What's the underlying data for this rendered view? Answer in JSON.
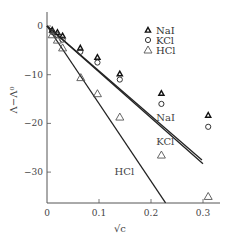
{
  "chart_data": {
    "type": "scatter",
    "title": "",
    "xlabel": "√c",
    "ylabel": "Λ − Λ⁰",
    "xlim": [
      0,
      0.335
    ],
    "ylim": [
      -36,
      3
    ],
    "xticks": [
      0,
      0.1,
      0.2,
      0.3
    ],
    "xtick_labels": [
      "0",
      "0.1",
      "0.2",
      "0.3"
    ],
    "yticks": [
      0,
      -10,
      -20,
      -30
    ],
    "ytick_labels": [
      "0",
      "−10",
      "−20",
      "−30"
    ],
    "grid": false,
    "legend_position": "upper-center-right",
    "series": [
      {
        "name": "NaI",
        "marker": "filled-small-triangle",
        "points": [
          [
            0.01,
            -0.8
          ],
          [
            0.02,
            -1.3
          ],
          [
            0.03,
            -2.0
          ],
          [
            0.064,
            -4.5
          ],
          [
            0.097,
            -6.4
          ],
          [
            0.14,
            -9.8
          ],
          [
            0.22,
            -13.8
          ],
          [
            0.31,
            -18.3
          ]
        ]
      },
      {
        "name": "KCl",
        "marker": "circle",
        "points": [
          [
            0.01,
            -1.2
          ],
          [
            0.02,
            -1.9
          ],
          [
            0.03,
            -2.8
          ],
          [
            0.064,
            -5.3
          ],
          [
            0.097,
            -7.5
          ],
          [
            0.14,
            -11.0
          ],
          [
            0.22,
            -16.0
          ],
          [
            0.31,
            -20.7
          ]
        ]
      },
      {
        "name": "HCl",
        "marker": "open-triangle",
        "points": [
          [
            0.01,
            -1.8
          ],
          [
            0.02,
            -2.9
          ],
          [
            0.03,
            -4.5
          ],
          [
            0.065,
            -10.6
          ],
          [
            0.097,
            -13.9
          ],
          [
            0.14,
            -18.7
          ],
          [
            0.22,
            -26.5
          ],
          [
            0.31,
            -35.0
          ]
        ]
      }
    ],
    "lines": [
      {
        "name": "NaI",
        "from": [
          0,
          0
        ],
        "to": [
          0.298,
          -27.5
        ],
        "label_at": [
          0.21,
          -19.5
        ]
      },
      {
        "name": "KCl",
        "from": [
          0,
          0
        ],
        "to": [
          0.3,
          -28.3
        ],
        "label_at": [
          0.21,
          -24.5
        ]
      },
      {
        "name": "HCl",
        "from": [
          0,
          0
        ],
        "to": [
          0.228,
          -36.3
        ],
        "label_at": [
          0.13,
          -30.5
        ]
      }
    ]
  },
  "legend": {
    "items": [
      {
        "label": "NaI"
      },
      {
        "label": "KCl"
      },
      {
        "label": "HCl"
      }
    ]
  },
  "axes": {
    "xlabel": "√c",
    "ylabel": "Λ−Λ⁰"
  },
  "line_labels": {
    "nai": "NaI",
    "kcl": "KCl",
    "hcl": "HCl"
  }
}
